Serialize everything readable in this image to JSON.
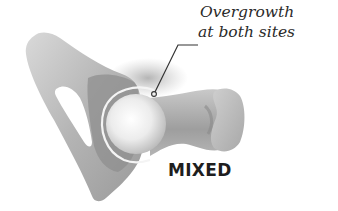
{
  "figure": {
    "type_label": "MIXED",
    "callout": {
      "line1": "Overgrowth",
      "line2": "at both sites"
    },
    "colors": {
      "background": "#ffffff",
      "bone_light": "#d6d6d6",
      "bone_mid": "#a9a9a9",
      "bone_dark": "#7d7d7d",
      "femoral_head": "#f2f2f2",
      "text": "#222222"
    }
  }
}
